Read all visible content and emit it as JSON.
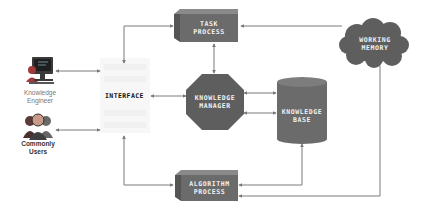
{
  "diagram": {
    "title": "",
    "colors": {
      "node_fill": "#6b6b6b",
      "node_dark": "#555555",
      "node_top": "#8a8a8a",
      "arrow": "#7a7a7a",
      "label_on_node": "#f2f2f2",
      "interface_bg": "#f7f7f7"
    },
    "actors": [
      {
        "id": "knowledge-engineer",
        "label_line1": "Knowledge",
        "label_line2": "Engineer",
        "icon": "computer-workstation-icon"
      },
      {
        "id": "commonly-users",
        "label_line1": "Commonly",
        "label_line2": "Users",
        "icon": "user-group-icon"
      }
    ],
    "nodes": {
      "interface": {
        "label": "INTERFACE",
        "shape": "faded-panel"
      },
      "task_process": {
        "line1": "TASK",
        "line2": "PROCESS",
        "shape": "3d-box"
      },
      "knowledge_manager": {
        "line1": "KNOWLEDGE",
        "line2": "MANAGER",
        "shape": "octagon"
      },
      "knowledge_base": {
        "line1": "KNOWLEDGE",
        "line2": "BASE",
        "shape": "cylinder"
      },
      "working_memory": {
        "line1": "WORKING",
        "line2": "MEMORY",
        "shape": "cloud"
      },
      "algorithm_process": {
        "line1": "ALGORITHM",
        "line2": "PROCESS",
        "shape": "3d-box"
      }
    },
    "edges": [
      {
        "from": "knowledge-engineer",
        "to": "interface",
        "direction": "both"
      },
      {
        "from": "commonly-users",
        "to": "interface",
        "direction": "both"
      },
      {
        "from": "interface",
        "to": "task_process",
        "direction": "both"
      },
      {
        "from": "interface",
        "to": "knowledge_manager",
        "direction": "both"
      },
      {
        "from": "interface",
        "to": "algorithm_process",
        "direction": "both"
      },
      {
        "from": "task_process",
        "to": "knowledge_manager",
        "direction": "both"
      },
      {
        "from": "working_memory",
        "to": "task_process",
        "direction": "forward"
      },
      {
        "from": "knowledge_manager",
        "to": "knowledge_base",
        "direction": "both"
      },
      {
        "from": "knowledge_base",
        "to": "knowledge_manager",
        "direction": "both"
      },
      {
        "from": "knowledge_base",
        "to": "algorithm_process",
        "direction": "both"
      },
      {
        "from": "working_memory",
        "to": "algorithm_process",
        "direction": "forward"
      }
    ]
  }
}
